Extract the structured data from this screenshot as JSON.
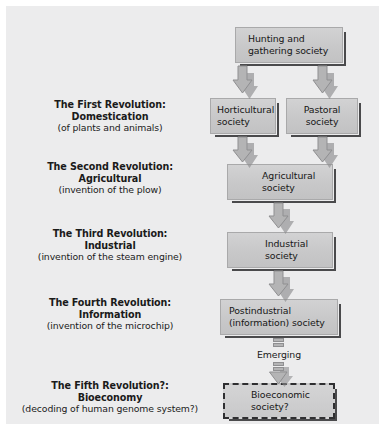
{
  "diagram": {
    "background_color": "#ececed",
    "box_fill_color": "#c8c8c9",
    "box_border_color": "#a9a9aa",
    "shadow_color": "#4a4a4c",
    "arrow_fill_color": "#b4b4b5",
    "text_color": "#1a1a1a"
  },
  "revolutions": [
    {
      "id": "first",
      "line1": "The First Revolution:",
      "line2": "Domestication",
      "line3": "(of plants and animals)"
    },
    {
      "id": "second",
      "line1": "The Second Revolution:",
      "line2": "Agricultural",
      "line3": "(invention of the plow)"
    },
    {
      "id": "third",
      "line1": "The Third Revolution:",
      "line2": "Industrial",
      "line3": "(invention of the steam engine)"
    },
    {
      "id": "fourth",
      "line1": "The Fourth Revolution:",
      "line2": "Information",
      "line3": "(invention of the microchip)"
    },
    {
      "id": "fifth",
      "line1": "The Fifth Revolution?:",
      "line2": "Bioeconomy",
      "line3": "(decoding of human genome system?)"
    }
  ],
  "nodes": [
    {
      "id": "hunting",
      "line1": "Hunting and",
      "line2": "gathering society"
    },
    {
      "id": "horticultural",
      "line1": "Horticultural",
      "line2": "society"
    },
    {
      "id": "pastoral",
      "line1": "Pastoral",
      "line2": "society"
    },
    {
      "id": "agricultural",
      "line1": "Agricultural",
      "line2": "society"
    },
    {
      "id": "industrial",
      "line1": "Industrial",
      "line2": "society"
    },
    {
      "id": "postindustrial",
      "line1": "Postindustrial",
      "line2": "(information) society"
    },
    {
      "id": "bioeconomic",
      "line1": "Bioeconomic",
      "line2": "society?"
    }
  ],
  "connectors": {
    "emerging_label": "Emerging"
  }
}
